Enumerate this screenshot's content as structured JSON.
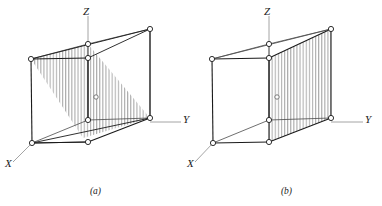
{
  "figure": {
    "type": "crystallographic-unit-cell-diagram",
    "panels": [
      {
        "id": "a",
        "caption": "(a)",
        "plane_description": "diagonal plane through cube (110-type)",
        "hatch_style": "vertical-line-shading",
        "axes": [
          {
            "name": "Z",
            "label": "Z",
            "direction": "up"
          },
          {
            "name": "Y",
            "label": "Y",
            "direction": "right"
          },
          {
            "name": "X",
            "label": "X",
            "direction": "lower-left"
          }
        ],
        "lattice_points": 8,
        "center_marker": "open-circle"
      },
      {
        "id": "b",
        "caption": "(b)",
        "plane_description": "right face of cube (100-type)",
        "hatch_style": "vertical-line-shading",
        "axes": [
          {
            "name": "Z",
            "label": "Z",
            "direction": "up"
          },
          {
            "name": "Y",
            "label": "Y",
            "direction": "right"
          },
          {
            "name": "X",
            "label": "X",
            "direction": "lower-left"
          }
        ],
        "lattice_points": 8,
        "center_marker": "open-circle"
      }
    ]
  },
  "colors": {
    "line": "#1a1a1a",
    "axis_line": "#8c8c8c",
    "hatch": "#9a9a9a",
    "background": "#ffffff",
    "vertex_fill": "#ffffff"
  }
}
